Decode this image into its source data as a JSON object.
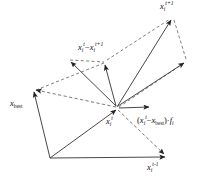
{
  "figure": {
    "type": "vector-diagram",
    "width": 201,
    "height": 187,
    "background_color": "#ffffff",
    "line_color": "#333333",
    "dashed_color": "#555555",
    "text_color": "#111111"
  },
  "labels": {
    "x_t_plus_1": {
      "base": "x",
      "sub": "i",
      "sup": "t+1",
      "text": "x_i^{t+1}"
    },
    "diff_x": {
      "text": "x_i^t - x_i^{t+1}",
      "base1": "x",
      "sub1": "i",
      "sup1": "t",
      "op": "−",
      "base2": "x",
      "sub2": "i",
      "sup2": "t+1"
    },
    "x_best": {
      "base": "x",
      "sub": "best",
      "text": "x_best"
    },
    "x_i_t": {
      "base": "x",
      "sub": "i",
      "sup": "t",
      "text": "x_i^t"
    },
    "best_term": {
      "text": "(x_i^t - x_best) · f_i",
      "open": "(",
      "base1": "x",
      "sub1": "i",
      "sup1": "t",
      "op": "−",
      "base2": "x",
      "sub2": "best",
      "close": ")·",
      "base3": "f",
      "sub3": "i"
    },
    "x_t_minus_1": {
      "base": "x",
      "sub": "i",
      "sup": "t-1",
      "text": "x_i^{t-1}"
    }
  },
  "nodes": {
    "hub": {
      "name": "x_i^t",
      "x": 117,
      "y": 108
    },
    "top_right": {
      "name": "x_i^{t+1}",
      "x": 172,
      "y": 17
    },
    "upper_left": {
      "name": "upper-left-endpoint",
      "x": 70,
      "y": 60
    },
    "mid_upper": {
      "name": "mid-upper-endpoint",
      "x": 106,
      "y": 62
    },
    "right_mid": {
      "name": "right-mid-endpoint",
      "x": 185,
      "y": 62
    },
    "x_best": {
      "name": "x_best",
      "x": 33,
      "y": 89
    },
    "short_right": {
      "name": "short-right-endpoint",
      "x": 150,
      "y": 108
    },
    "bottom_left": {
      "name": "bottom-left-vertex",
      "x": 50,
      "y": 158
    },
    "bottom_right": {
      "name": "x_i^{t-1}",
      "x": 166,
      "y": 157
    }
  },
  "edges": [
    {
      "name": "hub-to-top-right",
      "style": "solid",
      "arrow": true,
      "from": "hub",
      "to": "top_right"
    },
    {
      "name": "hub-to-upper-left",
      "style": "solid",
      "arrow": true,
      "from": "hub",
      "to": "upper_left"
    },
    {
      "name": "hub-to-mid-upper",
      "style": "solid",
      "arrow": true,
      "from": "hub",
      "to": "mid_upper"
    },
    {
      "name": "hub-to-right-mid",
      "style": "solid",
      "arrow": true,
      "from": "hub",
      "to": "right_mid"
    },
    {
      "name": "hub-to-short-right",
      "style": "solid",
      "arrow": true,
      "from": "hub",
      "to": "short_right"
    },
    {
      "name": "hub-to-x-best-dashed",
      "style": "dashed",
      "arrow": true,
      "from": "hub",
      "to": "x_best"
    },
    {
      "name": "hub-to-bottom-right-dashed",
      "style": "dashed",
      "arrow": true,
      "from": "hub",
      "to": "bottom_right"
    },
    {
      "name": "bottom-left-to-hub",
      "style": "solid",
      "arrow": true,
      "from": "bottom_left",
      "to": "hub"
    },
    {
      "name": "bottom-left-to-bottom-right",
      "style": "solid",
      "arrow": true,
      "from": "bottom_left",
      "to": "bottom_right"
    },
    {
      "name": "bottom-left-to-x-best",
      "style": "solid",
      "arrow": true,
      "from": "bottom_left",
      "to": "x_best"
    },
    {
      "name": "x-best-to-top-right-dashed",
      "style": "dashed",
      "arrow": false,
      "from": "x_best",
      "to": "mid_upper"
    },
    {
      "name": "mid-upper-to-top-right-dashed",
      "style": "dashed",
      "arrow": false,
      "from": "mid_upper",
      "to": "top_right"
    },
    {
      "name": "top-right-to-right-mid-dashed",
      "style": "dashed",
      "arrow": false,
      "from": "top_right",
      "to": "right_mid"
    },
    {
      "name": "right-mid-to-hub-dashed",
      "style": "dashed",
      "arrow": false,
      "from": "right_mid",
      "to": "hub"
    },
    {
      "name": "upper-left-to-mid-upper-dashed",
      "style": "dashed",
      "arrow": false,
      "from": "upper_left",
      "to": "mid_upper"
    }
  ]
}
